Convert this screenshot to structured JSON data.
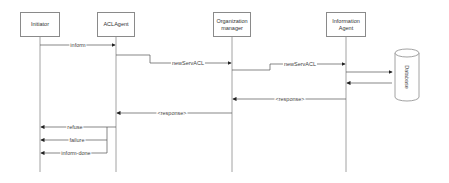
{
  "diagram": {
    "type": "sequence",
    "participants": [
      {
        "id": "initiator",
        "label": "Initiator"
      },
      {
        "id": "aclagent",
        "label": "ACLAgent"
      },
      {
        "id": "orgmanager",
        "label": "Organization manager"
      },
      {
        "id": "infoagent",
        "label": "Information Agent"
      }
    ],
    "database": {
      "label": "Database"
    },
    "messages": [
      {
        "from": "Initiator",
        "to": "ACLAgent",
        "label": "inform"
      },
      {
        "from": "ACLAgent",
        "to": "Organization manager",
        "label": "newServACL"
      },
      {
        "from": "Organization manager",
        "to": "Information Agent",
        "label": "newServACL"
      },
      {
        "from": "Information Agent",
        "to": "Database",
        "label": ""
      },
      {
        "from": "Database",
        "to": "Information Agent",
        "label": ""
      },
      {
        "from": "Information Agent",
        "to": "Organization manager",
        "label": "<response>"
      },
      {
        "from": "Organization manager",
        "to": "ACLAgent",
        "label": "<response>"
      },
      {
        "from": "ACLAgent",
        "to": "Initiator",
        "label": "refuse"
      },
      {
        "from": "ACLAgent",
        "to": "Initiator",
        "label": "failure"
      },
      {
        "from": "ACLAgent",
        "to": "Initiator",
        "label": "inform-done"
      }
    ]
  },
  "colors": {
    "line": "#8a8a8a",
    "arrow": "#222222",
    "text": "#444444"
  }
}
